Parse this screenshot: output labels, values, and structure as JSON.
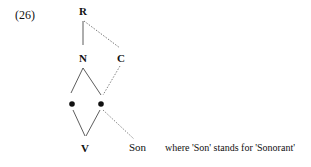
{
  "example_number": "(26)",
  "tree": {
    "nodes": {
      "root": "R",
      "nucleus": "N",
      "coda": "C",
      "vowel": "V",
      "sonorant": "Son"
    }
  },
  "note": "where 'Son' stands for 'Sonorant'"
}
